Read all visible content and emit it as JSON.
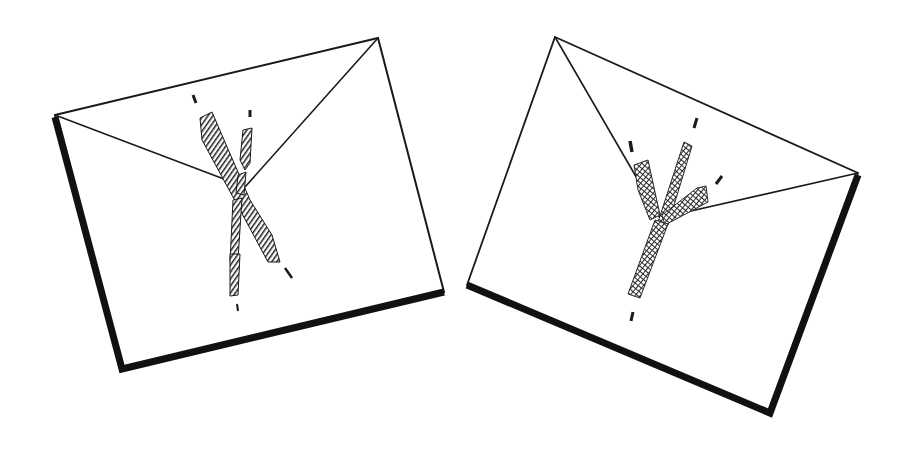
{
  "scene": {
    "description": "Two hand-drawn envelopes, each marked with a sketched letter on the flap",
    "background": "#ffffff",
    "ink_color": "#1a1a1a",
    "mark_color": "#2a2a2a"
  },
  "envelopes": [
    {
      "id": "left",
      "letter": "X",
      "corners": {
        "tl": [
          55,
          115
        ],
        "tr": [
          378,
          38
        ],
        "br": [
          444,
          292
        ],
        "bl": [
          122,
          369
        ]
      },
      "flap_apex": [
        245,
        187
      ]
    },
    {
      "id": "right",
      "letter": "Y",
      "corners": {
        "tl": [
          555,
          37
        ],
        "tr": [
          858,
          173
        ],
        "br": [
          770,
          413
        ],
        "bl": [
          467,
          285
        ]
      },
      "flap_apex": [
        660,
        218
      ]
    }
  ]
}
